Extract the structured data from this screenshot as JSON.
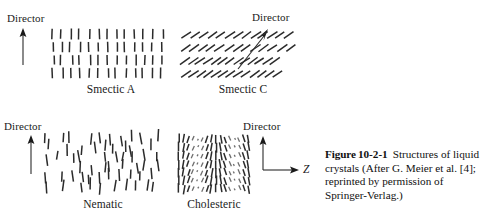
{
  "figure": {
    "caption_bold": "Figure",
    "caption_number": "10-2-1",
    "caption_text": "Structures of liquid crystals (After G. Meier et al. [4]; reprinted by permission of Springer-Verlag.)"
  },
  "panels": {
    "smectic_a": {
      "label": "Smectic A",
      "director_label": "Director",
      "director_direction": "up",
      "description": "Rod-like molecules aligned vertically, organized into four distinct horizontal layers",
      "layers": 4,
      "rods_per_layer": 13,
      "rod_tilt_deg": 0
    },
    "smectic_c": {
      "label": "Smectic C",
      "director_label": "Director",
      "director_direction": "diagonal-up-right",
      "description": "Rod-like molecules tilted within four distinct horizontal layers",
      "layers": 4,
      "rods_per_layer": 13,
      "rod_tilt_deg": 55
    },
    "nematic": {
      "label": "Nematic",
      "director_label": "Director",
      "director_direction": "up",
      "description": "Rod-like molecules aligned along the director but positionally disordered",
      "layers": 0,
      "rod_tilt_deg": 0
    },
    "cholesteric": {
      "label": "Cholesteric",
      "director_label": "Director",
      "director_direction": "up",
      "axis_label": "Z",
      "axis_direction": "right",
      "description": "Helically twisted structure; molecular orientation rotates progressively along the Z axis"
    }
  },
  "colors": {
    "ink": "#2b2b2b",
    "ink_light": "#6d6d6d",
    "background": "#ffffff",
    "text": "#1a1a1a"
  }
}
